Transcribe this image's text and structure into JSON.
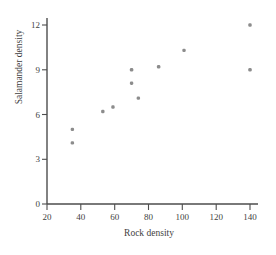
{
  "figure": {
    "cropped_top_text": "",
    "point_color": "#8c8c8c",
    "axis_color": "#4d4d4d",
    "background": "#ffffff"
  },
  "chart_data": {
    "type": "scatter",
    "title": "",
    "xlabel": "Rock density",
    "ylabel": "Salamander density",
    "xlim": [
      20,
      145
    ],
    "ylim": [
      0,
      12.8
    ],
    "xticks": [
      20,
      40,
      60,
      80,
      100,
      120,
      140
    ],
    "yticks": [
      0,
      3,
      6,
      9,
      12
    ],
    "grid": false,
    "legend": null,
    "x": [
      35,
      35,
      53,
      59,
      70,
      70,
      74,
      86,
      101,
      140,
      140
    ],
    "y": [
      5.0,
      4.1,
      6.2,
      6.5,
      9.0,
      8.1,
      7.1,
      9.2,
      10.3,
      12.0,
      9.0
    ],
    "points": [
      {
        "x": 35,
        "y": 5.0
      },
      {
        "x": 35,
        "y": 4.1
      },
      {
        "x": 53,
        "y": 6.2
      },
      {
        "x": 59,
        "y": 6.5
      },
      {
        "x": 70,
        "y": 9.0
      },
      {
        "x": 70,
        "y": 8.1
      },
      {
        "x": 74,
        "y": 7.1
      },
      {
        "x": 86,
        "y": 9.2
      },
      {
        "x": 101,
        "y": 10.3
      },
      {
        "x": 140,
        "y": 12.0
      },
      {
        "x": 140,
        "y": 9.0
      }
    ]
  }
}
